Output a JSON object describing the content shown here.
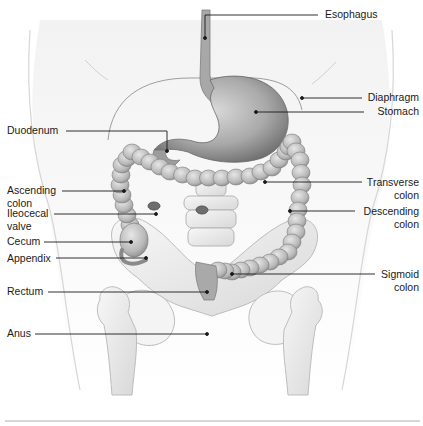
{
  "diagram": {
    "labels": {
      "esophagus": "Esophagus",
      "diaphragm": "Diaphragm",
      "stomach": "Stomach",
      "duodenum": "Duodenum",
      "transverse_colon": "Transverse\ncolon",
      "ascending_colon": "Ascending\ncolon",
      "ileocecal_valve": "Ileocecal\nvalve",
      "descending_colon": "Descending\ncolon",
      "cecum": "Cecum",
      "appendix": "Appendix",
      "sigmoid_colon": "Sigmoid\ncolon",
      "rectum": "Rectum",
      "anus": "Anus"
    },
    "colors": {
      "leader_line": "#1a1a1a",
      "organ_fill": "#bdbdbd",
      "organ_shadow": "#8a8a8a",
      "bone_fill": "#efefef",
      "skin_outline": "#cfcfcf",
      "separator": "#9a9a9a"
    }
  }
}
